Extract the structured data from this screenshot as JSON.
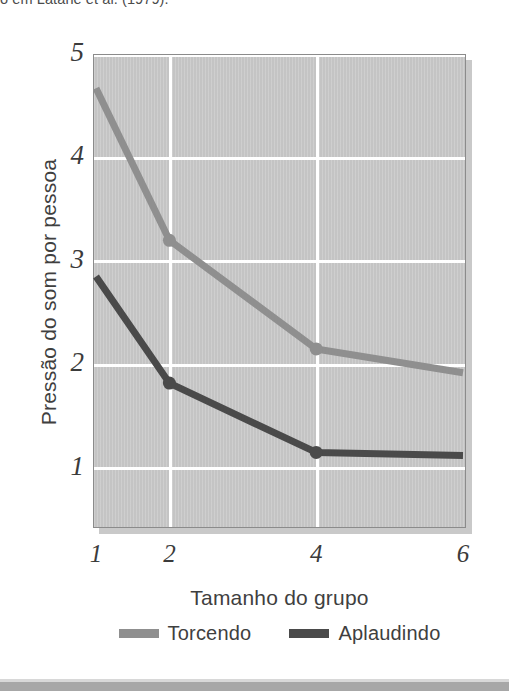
{
  "caption": {
    "text": "o em Latané et al. (1979)."
  },
  "chart_data": {
    "type": "line",
    "title": "",
    "xlabel": "Tamanho do grupo",
    "ylabel": "Pressão do som por pessoa",
    "x": [
      1,
      2,
      4,
      6
    ],
    "xticklabels": [
      "1",
      "2",
      "4",
      "6"
    ],
    "yticklabels": [
      "1",
      "2",
      "3",
      "4",
      "5"
    ],
    "yticks": [
      1,
      2,
      3,
      4,
      5
    ],
    "xlim": [
      1,
      6
    ],
    "ylim": [
      0.42,
      5
    ],
    "grid": true,
    "legend_position": "bottom",
    "plot_background": "#c4c4c4",
    "gridline_color": "#ffffff",
    "series": [
      {
        "name": "Torcendo",
        "color": "#8f8f8f",
        "values": [
          4.67,
          3.2,
          2.15,
          1.92
        ]
      },
      {
        "name": "Aplaudindo",
        "color": "#4a4a4a",
        "values": [
          2.85,
          1.82,
          1.15,
          1.12
        ]
      }
    ]
  },
  "legend": {
    "items": [
      {
        "label": "Torcendo",
        "color": "#8f8f8f"
      },
      {
        "label": "Aplaudindo",
        "color": "#4a4a4a"
      }
    ]
  }
}
